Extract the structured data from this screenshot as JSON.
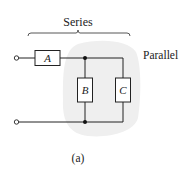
{
  "diagram": {
    "type": "circuit",
    "labels": {
      "series": "Series",
      "parallel": "Parallel",
      "caption": "(a)"
    },
    "components": [
      {
        "id": "A",
        "label": "A",
        "connection": "series"
      },
      {
        "id": "B",
        "label": "B",
        "connection": "parallel"
      },
      {
        "id": "C",
        "label": "C",
        "connection": "parallel"
      }
    ],
    "terminals": 2,
    "junctions": 2,
    "colors": {
      "wire": "#222222",
      "box_fill": "#ffffff",
      "highlight": "#efefef",
      "text": "#222222"
    }
  }
}
